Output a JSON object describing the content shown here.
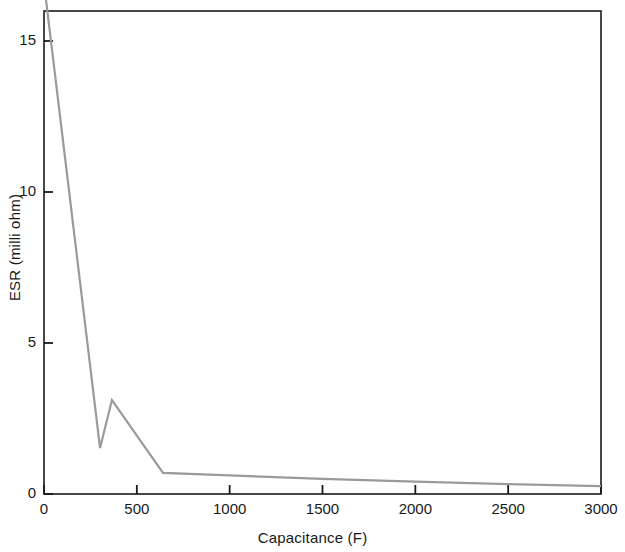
{
  "chart_data": {
    "type": "line",
    "title": "",
    "xlabel": "Capacitance (F)",
    "ylabel": "ESR (milli ohm)",
    "xlim": [
      0,
      3000
    ],
    "ylim": [
      0,
      16.4
    ],
    "xticks": [
      0,
      500,
      1000,
      1500,
      2000,
      2500,
      3000
    ],
    "xtick_labels": [
      "0",
      "500",
      "1000",
      "1500",
      "2000",
      "2500",
      "3000"
    ],
    "yticks": [
      0,
      5,
      10,
      15
    ],
    "ytick_labels": [
      "0",
      "5",
      "10",
      "15"
    ],
    "grid": false,
    "legend": null,
    "line_color": "#9a9a9a",
    "line_width": 2.2,
    "axis_color": "#1a1a1a",
    "series": [
      {
        "name": "ESR vs Capacitance",
        "x": [
          10,
          302,
          366,
          641,
          1500,
          2000,
          2500,
          3000
        ],
        "y": [
          16.4,
          1.52,
          3.11,
          0.7,
          0.5,
          0.41,
          0.33,
          0.26
        ]
      }
    ]
  }
}
